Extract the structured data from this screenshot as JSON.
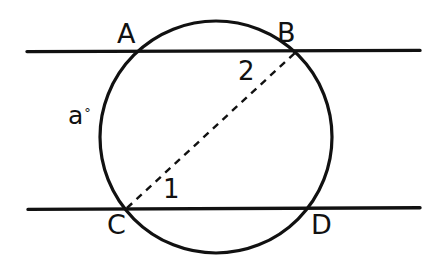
{
  "diagram": {
    "type": "circle-geometry",
    "background_color": "#ffffff",
    "stroke_color": "#111111",
    "canvas": {
      "width": 440,
      "height": 267
    },
    "circle": {
      "center_x": 216,
      "center_y": 137,
      "radius": 116,
      "stroke_width": 3.2
    },
    "lines": [
      {
        "name": "upper-parallel-line",
        "y": 51,
        "x_start": 27,
        "x_end": 420,
        "stroke_width": 3.4
      },
      {
        "name": "lower-parallel-line",
        "y": 209,
        "x_start": 28,
        "x_end": 420,
        "stroke_width": 3.4
      }
    ],
    "chord_dashed": {
      "name": "chord-CB",
      "x1": 127,
      "y1": 208,
      "x2": 297,
      "y2": 51,
      "stroke_width": 2.4,
      "dash_pattern": "7 6"
    },
    "points": {
      "A": {
        "x": 137,
        "y": 51
      },
      "B": {
        "x": 297,
        "y": 51
      },
      "C": {
        "x": 127,
        "y": 208
      },
      "D": {
        "x": 305,
        "y": 209
      }
    },
    "labels": {
      "A": "A",
      "B": "B",
      "C": "C",
      "D": "D",
      "angle_a": "a",
      "degree_symbol": "°",
      "arc_1": "1",
      "arc_2": "2"
    }
  }
}
